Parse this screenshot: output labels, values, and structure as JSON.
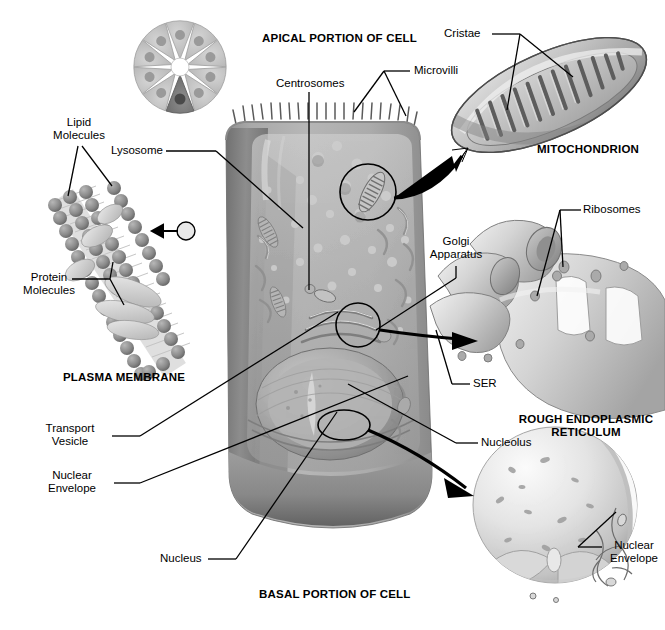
{
  "figure": {
    "type": "labeled-biological-illustration",
    "palette": {
      "background": "#ffffff",
      "ink": "#000000",
      "cell_body_light": "#b9b9b9",
      "cell_body_mid": "#9a9a9a",
      "cell_body_dark": "#6f6f6f",
      "cell_body_shadow": "#555555",
      "organelle_light": "#d2d2d2",
      "organelle_mid": "#a8a8a8",
      "membrane_head": "#8c8c8c",
      "membrane_protein": "#cfcfcf",
      "rosette_light": "#c8c8c8",
      "rosette_accent": "#7a7a7a"
    }
  },
  "headings": {
    "apical": "APICAL PORTION OF CELL",
    "basal": "BASAL PORTION OF CELL",
    "plasma_membrane": "PLASMA MEMBRANE",
    "mitochondrion": "MITOCHONDRION",
    "rough_er_line1": "ROUGH ENDOPLASMIC",
    "rough_er_line2": "RETICULUM"
  },
  "labels": {
    "lipid_molecules": "Lipid\nMolecules",
    "lysosome": "Lysosome",
    "centrosomes": "Centrosomes",
    "microvilli": "Microvilli",
    "cristae": "Cristae",
    "ribosomes": "Ribosomes",
    "golgi_apparatus": "Golgi\nApparatus",
    "protein_molecules": "Protein\nMolecules",
    "ser": "SER",
    "transport_vesicle": "Transport\nVesicle",
    "nuclear_envelope_left": "Nuclear\nEnvelope",
    "nucleolus": "Nucleolus",
    "nucleus": "Nucleus",
    "nuclear_envelope_right": "Nuclear\nEnvelope"
  },
  "insets": {
    "rosette": {
      "name": "epithelial-rosette-cross-section",
      "wedge_count": 10,
      "highlighted_wedge_index": 7
    },
    "plasma_membrane": {
      "name": "phospholipid-bilayer-detail",
      "features": [
        "lipid head groups",
        "lipid tails",
        "integral proteins"
      ]
    },
    "mitochondrion": {
      "name": "mitochondrion-detail",
      "cristae_count": 14
    },
    "rough_er": {
      "name": "rough-endoplasmic-reticulum-detail",
      "features": [
        "cisternae",
        "ribosomes"
      ]
    },
    "nucleus": {
      "name": "nucleus-detail",
      "features": [
        "nuclear envelope",
        "nuclear pores",
        "chromatin"
      ]
    }
  },
  "cell_body": {
    "name": "generalized-epithelial-cell",
    "organelles": [
      "microvilli",
      "lysosome",
      "centrosomes",
      "mitochondria",
      "golgi apparatus",
      "smooth endoplasmic reticulum",
      "rough endoplasmic reticulum",
      "transport vesicle",
      "nucleus",
      "nucleolus",
      "nuclear envelope"
    ],
    "callout_circles": 3
  }
}
